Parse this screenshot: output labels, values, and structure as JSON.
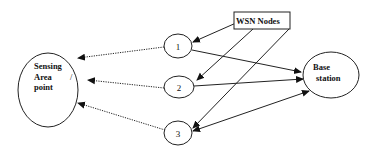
{
  "diagram": {
    "sensing_area": {
      "lines": [
        "Sensing",
        "Area      /",
        "point"
      ]
    },
    "base_station": {
      "lines": [
        "Base",
        "station"
      ]
    },
    "wsn_box": {
      "label": "WSN Nodes"
    },
    "nodes": [
      {
        "label": "1"
      },
      {
        "label": "2"
      },
      {
        "label": "3"
      }
    ],
    "edges": [
      {
        "from": "node-1",
        "to": "sensing-area",
        "style": "dotted"
      },
      {
        "from": "node-2",
        "to": "sensing-area",
        "style": "dotted"
      },
      {
        "from": "node-3",
        "to": "sensing-area",
        "style": "dotted"
      },
      {
        "from": "node-1",
        "to": "base-station",
        "style": "solid"
      },
      {
        "from": "node-2",
        "to": "base-station",
        "style": "solid"
      },
      {
        "from": "node-3",
        "to": "base-station",
        "style": "solid",
        "bidirectional": true
      },
      {
        "from": "wsn-box",
        "to": "node-1",
        "style": "solid"
      },
      {
        "from": "wsn-box",
        "to": "node-2",
        "style": "solid"
      },
      {
        "from": "wsn-box",
        "to": "node-3",
        "style": "solid"
      }
    ]
  }
}
